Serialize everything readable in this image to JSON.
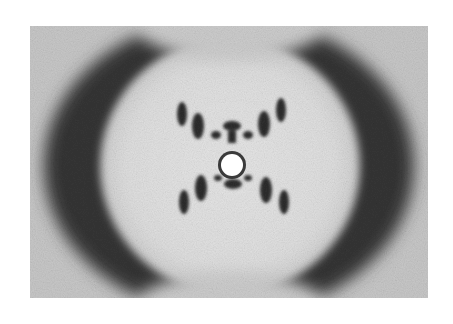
{
  "image": {
    "subject": "X-ray diffraction pattern",
    "description": "Grayscale X-shaped diffraction pattern with dark crescent arcs on left and right, a central circular beam stop, and layer-line spots forming an X.",
    "colors": {
      "background": "#ffffff",
      "field": "#c9c9c9",
      "halo": "#e4e4e4",
      "dark": "#2a2a2a"
    }
  }
}
